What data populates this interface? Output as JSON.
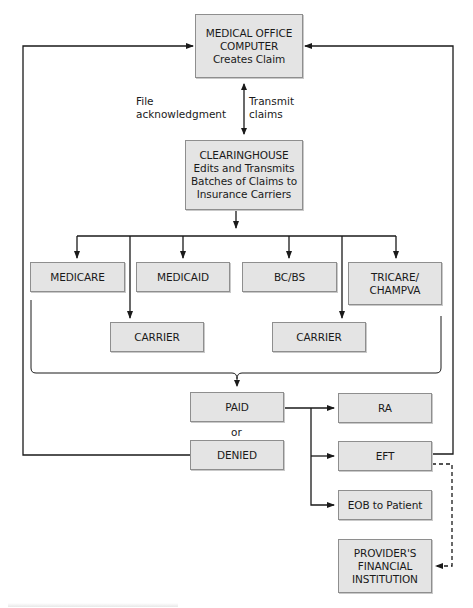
{
  "diagram": {
    "type": "flowchart",
    "colors": {
      "box_fill": "#e4e4e4",
      "box_border": "#8e8e8e",
      "line": "#1a1a1a"
    },
    "nodes": {
      "medical_office": {
        "line1": "MEDICAL OFFICE",
        "line2": "COMPUTER",
        "line3": "Creates Claim"
      },
      "clearinghouse": {
        "line1": "CLEARINGHOUSE",
        "line2": "Edits and Transmits",
        "line3": "Batches of Claims to",
        "line4": "Insurance Carriers"
      },
      "medicare": {
        "label": "MEDICARE"
      },
      "medicaid": {
        "label": "MEDICAID"
      },
      "bcbs": {
        "label": "BC/BS"
      },
      "tricare": {
        "line1": "TRICARE/",
        "line2": "CHAMPVA"
      },
      "carrier_left": {
        "label": "CARRIER"
      },
      "carrier_right": {
        "label": "CARRIER"
      },
      "paid": {
        "label": "PAID"
      },
      "denied": {
        "label": "DENIED"
      },
      "ra": {
        "label": "RA"
      },
      "eft": {
        "label": "EFT"
      },
      "eob": {
        "label": "EOB to Patient"
      },
      "provider_institution": {
        "line1": "PROVIDER'S",
        "line2": "FINANCIAL",
        "line3": "INSTITUTION"
      }
    },
    "edge_labels": {
      "file_ack_line1": "File",
      "file_ack_line2": "acknowledgment",
      "transmit_line1": "Transmit",
      "transmit_line2": "claims",
      "or": "or"
    },
    "edges": [
      {
        "from": "medical_office",
        "to": "clearinghouse",
        "label": "Transmit claims",
        "style": "solid"
      },
      {
        "from": "clearinghouse",
        "to": "medical_office",
        "label": "File acknowledgment",
        "style": "solid"
      },
      {
        "from": "clearinghouse",
        "to": "medicare",
        "style": "solid"
      },
      {
        "from": "clearinghouse",
        "to": "medicaid",
        "style": "solid"
      },
      {
        "from": "clearinghouse",
        "to": "bcbs",
        "style": "solid"
      },
      {
        "from": "clearinghouse",
        "to": "tricare",
        "style": "solid"
      },
      {
        "from": "clearinghouse",
        "to": "carrier_left",
        "style": "solid"
      },
      {
        "from": "clearinghouse",
        "to": "carrier_right",
        "style": "solid"
      },
      {
        "from": "payers",
        "to": "paid",
        "style": "brace"
      },
      {
        "from": "paid",
        "to": "ra",
        "style": "solid"
      },
      {
        "from": "paid",
        "to": "eft",
        "style": "solid"
      },
      {
        "from": "paid",
        "to": "eob",
        "style": "solid"
      },
      {
        "from": "denied",
        "to": "medical_office",
        "style": "solid"
      },
      {
        "from": "eft",
        "to": "medical_office",
        "style": "solid"
      },
      {
        "from": "eft",
        "to": "provider_institution",
        "style": "dashed"
      }
    ]
  }
}
